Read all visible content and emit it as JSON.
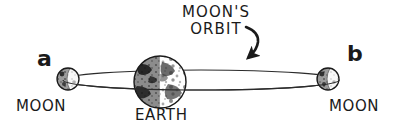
{
  "diagram": {
    "background_color": "#ffffff",
    "ink_color": "#1a1a1a",
    "labels": {
      "orbit_line1": "MOON'S",
      "orbit_line2": "ORBIT",
      "earth": "EARTH",
      "moon_left": "MOON",
      "moon_right": "MOON",
      "marker_a": "a",
      "marker_b": "b"
    },
    "bodies": [
      {
        "name": "moon-a",
        "label": "MOON",
        "marker": "a",
        "cx": 68,
        "cy": 79,
        "r": 11,
        "lit_side": "right"
      },
      {
        "name": "earth",
        "label": "EARTH",
        "cx": 160,
        "cy": 82,
        "r": 26,
        "lit_side": "right"
      },
      {
        "name": "moon-b",
        "label": "MOON",
        "marker": "b",
        "cx": 328,
        "cy": 79,
        "r": 11,
        "lit_side": "right"
      }
    ],
    "orbit": {
      "name": "moon-orbit-ellipse",
      "cx": 201,
      "cy": 80,
      "rx": 138,
      "ry": 10,
      "stroke_width": 1.2
    },
    "direction_arrow": {
      "name": "orbit-direction-arrow",
      "from_x": 247,
      "from_y": 27,
      "to_x": 248,
      "to_y": 60,
      "points": "clockwise-down-left"
    }
  }
}
